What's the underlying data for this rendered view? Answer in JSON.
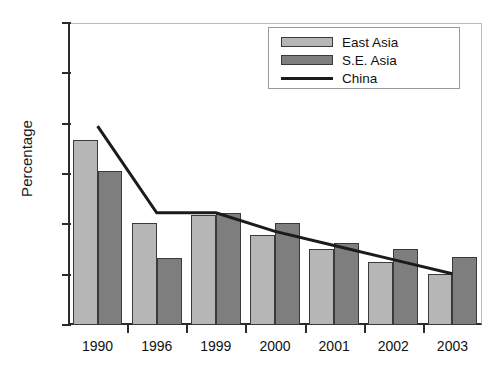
{
  "chart_data": {
    "type": "bar",
    "title": "",
    "xlabel": "",
    "ylabel": "Percentage",
    "ylim": [
      30.0,
      90.0
    ],
    "yticks": [
      "30.0",
      "40.0",
      "50.0",
      "60.0",
      "70.0",
      "80.0",
      "90.0"
    ],
    "ytick_values": [
      30.0,
      40.0,
      50.0,
      60.0,
      70.0,
      80.0,
      90.0
    ],
    "grid": false,
    "legend_position": "top-right",
    "categories": [
      "1990",
      "1996",
      "1999",
      "2000",
      "2001",
      "2002",
      "2003"
    ],
    "series": [
      {
        "name": "East Asia",
        "type": "bar",
        "color": "#b6b6b6",
        "values": [
          66.8,
          50.2,
          51.8,
          47.8,
          45.1,
          42.6,
          40.2
        ]
      },
      {
        "name": "S.E. Asia",
        "type": "bar",
        "color": "#7e7e7e",
        "values": [
          60.5,
          43.3,
          52.3,
          50.3,
          46.3,
          45.1,
          43.6
        ]
      },
      {
        "name": "China",
        "type": "line",
        "color": "#1b1b1b",
        "values": [
          69.5,
          52.3,
          52.3,
          48.6,
          45.8,
          43.0,
          40.2
        ]
      }
    ]
  },
  "legend": {
    "entries": [
      {
        "label": "East Asia",
        "kind": "bar-light"
      },
      {
        "label": "S.E. Asia",
        "kind": "bar-dark"
      },
      {
        "label": "China",
        "kind": "line"
      }
    ]
  }
}
